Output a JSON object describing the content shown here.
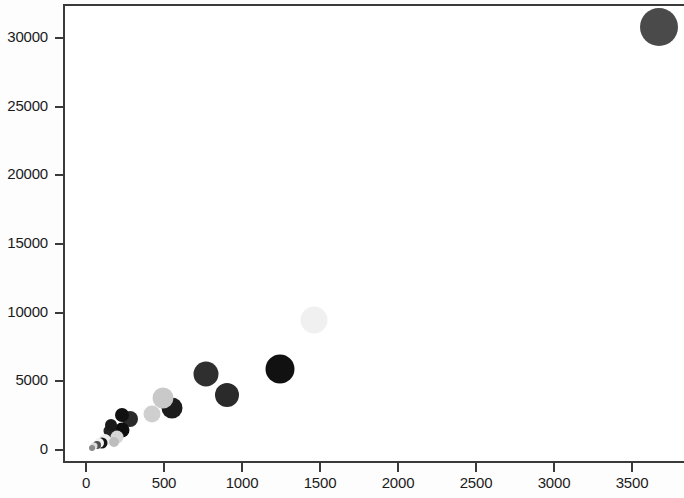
{
  "chart_data": {
    "type": "scatter",
    "title": "",
    "subtitle": "",
    "xlabel": "",
    "ylabel": "",
    "xlim": [
      -55,
      3925
    ],
    "ylim": [
      -270,
      33110
    ],
    "grid": false,
    "legend": null,
    "annotations": [],
    "xticks": [
      0,
      500,
      1000,
      1500,
      2000,
      2500,
      3000,
      3500
    ],
    "xtick_labels": [
      "0",
      "500",
      "1000",
      "1500",
      "2000",
      "2500",
      "3000",
      "3500"
    ],
    "yticks": [
      0,
      5000,
      10000,
      15000,
      20000,
      25000,
      30000
    ],
    "ytick_labels": [
      "0",
      "5000",
      "10000",
      "15000",
      "20000",
      "25000",
      "30000"
    ],
    "size_encoding": "marker radius encodes a third quantitative variable",
    "color_encoding": "grayscale fill encodes a categorical/ordinal variable",
    "points": [
      {
        "x": 3660,
        "y": 30900,
        "r": 19,
        "color": "#4a4a4a"
      },
      {
        "x": 1230,
        "y": 6030,
        "r": 14.5,
        "color": "#111111"
      },
      {
        "x": 755,
        "y": 5700,
        "r": 12.5,
        "color": "#2f2f2f"
      },
      {
        "x": 890,
        "y": 4180,
        "r": 12.0,
        "color": "#2a2a2a"
      },
      {
        "x": 1450,
        "y": 9600,
        "r": 13.5,
        "color": "#f0f0f0"
      },
      {
        "x": 540,
        "y": 3230,
        "r": 10.5,
        "color": "#1c1c1c"
      },
      {
        "x": 480,
        "y": 3900,
        "r": 10.5,
        "color": "#c9c9c9"
      },
      {
        "x": 410,
        "y": 2780,
        "r": 8.5,
        "color": "#cfcfcf"
      },
      {
        "x": 270,
        "y": 2430,
        "r": 8.0,
        "color": "#2a2a2a"
      },
      {
        "x": 220,
        "y": 1600,
        "r": 7.5,
        "color": "#0e0e0e"
      },
      {
        "x": 218,
        "y": 2700,
        "r": 7.0,
        "color": "#111111"
      },
      {
        "x": 140,
        "y": 1530,
        "r": 6.5,
        "color": "#232323"
      },
      {
        "x": 185,
        "y": 1100,
        "r": 6.5,
        "color": "#d5d5d5"
      },
      {
        "x": 110,
        "y": 900,
        "r": 6.0,
        "color": "#ededed"
      },
      {
        "x": 90,
        "y": 690,
        "r": 5.5,
        "color": "#151515"
      },
      {
        "x": 70,
        "y": 620,
        "r": 5.0,
        "color": "#f2f2f2"
      },
      {
        "x": 55,
        "y": 520,
        "r": 4.0,
        "color": "#4f4f4f"
      },
      {
        "x": 40,
        "y": 420,
        "r": 3.5,
        "color": "#dddddd"
      },
      {
        "x": 150,
        "y": 1950,
        "r": 6.0,
        "color": "#1a1a1a"
      },
      {
        "x": 165,
        "y": 760,
        "r": 5.0,
        "color": "#bdbdbd"
      },
      {
        "x": 25,
        "y": 300,
        "r": 3.0,
        "color": "#8a8a8a"
      }
    ]
  },
  "axes": {
    "x_origin_px": 86,
    "x_scale_px_per_unit": 0.156,
    "y_origin_px": 450,
    "y_scale_px_per_unit": 0.01374,
    "axis_color": "#3a3a3a"
  }
}
